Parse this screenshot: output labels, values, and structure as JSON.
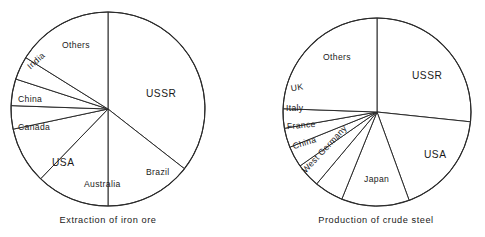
{
  "figure": {
    "background": "#ffffff",
    "line_color": "#2b2b2b",
    "text_color": "#1a1a1a"
  },
  "charts": [
    {
      "id": "extraction-of-iron-ore",
      "caption": "Extraction of iron ore",
      "center": {
        "x": 108,
        "y": 109
      },
      "radius": 97,
      "slices": [
        {
          "label": "USSR",
          "start_deg": 0,
          "end_deg": 128,
          "share_pct": 35.6,
          "label_pos": {
            "x": 146,
            "y": 94
          },
          "label_size": "big",
          "rotate_deg": 0
        },
        {
          "label": "Brazil",
          "start_deg": 128,
          "end_deg": 180,
          "share_pct": 14.4,
          "label_pos": {
            "x": 146,
            "y": 173
          },
          "label_size": "small",
          "rotate_deg": 0
        },
        {
          "label": "Australia",
          "start_deg": 180,
          "end_deg": 224,
          "share_pct": 12.2,
          "label_pos": {
            "x": 84,
            "y": 185
          },
          "label_size": "small",
          "rotate_deg": 0
        },
        {
          "label": "USA",
          "start_deg": 224,
          "end_deg": 258,
          "share_pct": 9.4,
          "label_pos": {
            "x": 52,
            "y": 163
          },
          "label_size": "big",
          "rotate_deg": 0
        },
        {
          "label": "Canada",
          "start_deg": 258,
          "end_deg": 272,
          "share_pct": 3.9,
          "label_pos": {
            "x": 18,
            "y": 128
          },
          "label_size": "small",
          "rotate_deg": 0
        },
        {
          "label": "China",
          "start_deg": 272,
          "end_deg": 288,
          "share_pct": 4.4,
          "label_pos": {
            "x": 18,
            "y": 100
          },
          "label_size": "small",
          "rotate_deg": 0
        },
        {
          "label": "India",
          "start_deg": 288,
          "end_deg": 302,
          "share_pct": 3.9,
          "label_pos": {
            "x": 29,
            "y": 68
          },
          "label_size": "small",
          "rotate_deg": -42
        },
        {
          "label": "Others",
          "start_deg": 302,
          "end_deg": 360,
          "share_pct": 16.1,
          "label_pos": {
            "x": 62,
            "y": 46
          },
          "label_size": "small",
          "rotate_deg": 0
        }
      ]
    },
    {
      "id": "production-of-crude-steel",
      "caption": "Production of crude steel",
      "center": {
        "x": 377,
        "y": 112
      },
      "radius": 94,
      "slices": [
        {
          "label": "USSR",
          "start_deg": 0,
          "end_deg": 96,
          "share_pct": 26.7,
          "label_pos": {
            "x": 412,
            "y": 76
          },
          "label_size": "big",
          "rotate_deg": 0
        },
        {
          "label": "USA",
          "start_deg": 96,
          "end_deg": 160,
          "share_pct": 17.8,
          "label_pos": {
            "x": 424,
            "y": 155
          },
          "label_size": "big",
          "rotate_deg": 0
        },
        {
          "label": "Japan",
          "start_deg": 160,
          "end_deg": 202,
          "share_pct": 11.7,
          "label_pos": {
            "x": 364,
            "y": 180
          },
          "label_size": "small",
          "rotate_deg": 0
        },
        {
          "label": "West Germany",
          "start_deg": 202,
          "end_deg": 220,
          "share_pct": 5.0,
          "label_pos": {
            "x": 304,
            "y": 172
          },
          "label_size": "small",
          "rotate_deg": -47
        },
        {
          "label": "China",
          "start_deg": 220,
          "end_deg": 235,
          "share_pct": 4.2,
          "label_pos": {
            "x": 293,
            "y": 147
          },
          "label_size": "small",
          "rotate_deg": -17
        },
        {
          "label": "France",
          "start_deg": 235,
          "end_deg": 248,
          "share_pct": 3.6,
          "label_pos": {
            "x": 287,
            "y": 127
          },
          "label_size": "small",
          "rotate_deg": -5
        },
        {
          "label": "Italy",
          "start_deg": 248,
          "end_deg": 260,
          "share_pct": 3.3,
          "label_pos": {
            "x": 286,
            "y": 109
          },
          "label_size": "small",
          "rotate_deg": 0
        },
        {
          "label": "UK",
          "start_deg": 260,
          "end_deg": 272,
          "share_pct": 3.3,
          "label_pos": {
            "x": 291,
            "y": 89
          },
          "label_size": "small",
          "rotate_deg": -9
        },
        {
          "label": "Others",
          "start_deg": 272,
          "end_deg": 360,
          "share_pct": 24.4,
          "label_pos": {
            "x": 323,
            "y": 58
          },
          "label_size": "small",
          "rotate_deg": 0
        }
      ]
    }
  ],
  "chart_data": [
    {
      "type": "pie",
      "title": "Extraction of iron ore",
      "xlabel": "",
      "ylabel": "",
      "legend_position": "none",
      "grid": false,
      "labels": [
        "USSR",
        "Brazil",
        "Australia",
        "USA",
        "Canada",
        "China",
        "India",
        "Others"
      ],
      "values": [
        35.6,
        14.4,
        12.2,
        9.4,
        3.9,
        4.4,
        3.9,
        16.1
      ],
      "units": "percent of world total",
      "start_angle_deg": 0,
      "direction": "clockwise",
      "slice_angles_deg": [
        128,
        52,
        44,
        34,
        14,
        16,
        14,
        58
      ]
    },
    {
      "type": "pie",
      "title": "Production of crude steel",
      "xlabel": "",
      "ylabel": "",
      "legend_position": "none",
      "grid": false,
      "labels": [
        "USSR",
        "USA",
        "Japan",
        "West Germany",
        "China",
        "France",
        "Italy",
        "UK",
        "Others"
      ],
      "values": [
        26.7,
        17.8,
        11.7,
        5.0,
        4.2,
        3.6,
        3.3,
        3.3,
        24.4
      ],
      "units": "percent of world total",
      "start_angle_deg": 0,
      "direction": "clockwise",
      "slice_angles_deg": [
        96,
        64,
        42,
        18,
        15,
        13,
        12,
        12,
        88
      ]
    }
  ]
}
